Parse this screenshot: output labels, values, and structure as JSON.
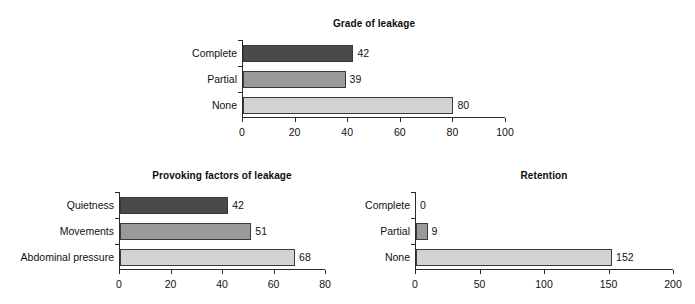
{
  "figure": {
    "background": "#ffffff",
    "width": 695,
    "height": 304
  },
  "palette": {
    "dark": "#4a4a4a",
    "medium": "#9a9a9a",
    "light": "#d2d2d2",
    "axis": "#2b2b2b",
    "text": "#111111"
  },
  "chart_data": [
    {
      "id": "grade-of-leakage",
      "type": "bar",
      "orientation": "horizontal",
      "title": "Grade of leakage",
      "xlabel": "",
      "ylabel": "",
      "categories": [
        "None",
        "Partial",
        "Complete"
      ],
      "values": [
        80,
        39,
        42
      ],
      "bar_colors": [
        "#d2d2d2",
        "#9a9a9a",
        "#4a4a4a"
      ],
      "value_labels": [
        "80",
        "39",
        "42"
      ],
      "xlim": [
        0,
        100
      ],
      "xticks": [
        0,
        20,
        40,
        60,
        80,
        100
      ],
      "xtick_labels": [
        "0",
        "20",
        "40",
        "60",
        "80",
        "100"
      ],
      "grid": false,
      "legend": false
    },
    {
      "id": "provoking-factors-of-leakage",
      "type": "bar",
      "orientation": "horizontal",
      "title": "Provoking factors of leakage",
      "xlabel": "",
      "ylabel": "",
      "categories": [
        "Abdominal pressure",
        "Movements",
        "Quietness"
      ],
      "values": [
        68,
        51,
        42
      ],
      "bar_colors": [
        "#d2d2d2",
        "#9a9a9a",
        "#4a4a4a"
      ],
      "value_labels": [
        "68",
        "51",
        "42"
      ],
      "xlim": [
        0,
        80
      ],
      "xticks": [
        0,
        20,
        40,
        60,
        80
      ],
      "xtick_labels": [
        "0",
        "20",
        "40",
        "60",
        "80"
      ],
      "grid": false,
      "legend": false
    },
    {
      "id": "retention",
      "type": "bar",
      "orientation": "horizontal",
      "title": "Retention",
      "xlabel": "",
      "ylabel": "",
      "categories": [
        "None",
        "Partial",
        "Complete"
      ],
      "values": [
        152,
        9,
        0
      ],
      "bar_colors": [
        "#d2d2d2",
        "#9a9a9a",
        "#4a4a4a"
      ],
      "value_labels": [
        "152",
        "9",
        "0"
      ],
      "xlim": [
        0,
        200
      ],
      "xticks": [
        0,
        50,
        100,
        150,
        200
      ],
      "xtick_labels": [
        "0",
        "50",
        "100",
        "150",
        "200"
      ],
      "grid": false,
      "legend": false
    }
  ]
}
